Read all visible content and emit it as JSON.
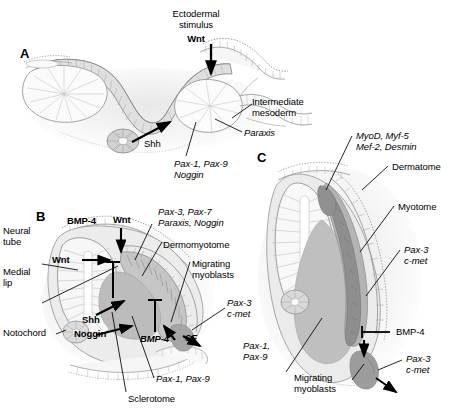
{
  "figure": {
    "type": "embryology-diagram"
  },
  "panels": {
    "a": {
      "letter": "A",
      "labels": {
        "ectodermal_stimulus": "Ectodermal\nstimulus",
        "wnt": "Wnt",
        "intermediate_mesoderm": "Intermediate\nmesoderm",
        "paraxis": "Paraxis",
        "shh": "Shh",
        "pax_noggin": "Pax-1, Pax-9\nNoggin"
      }
    },
    "b": {
      "letter": "B",
      "labels": {
        "neural_tube": "Neural\ntube",
        "medial_lip": "Medial\nlip",
        "notochord": "Notochord",
        "bmp4_top": "BMP-4",
        "wnt_top": "Wnt",
        "wnt_left": "Wnt",
        "shh": "Shh",
        "noggin": "Noggin",
        "bmp4_bottom": "BMP-4",
        "sf": "SF",
        "pax3_pax7": "Pax-3, Pax-7\nParaxis, Noggin",
        "dermomyotome": "Dermomyotome",
        "migrating_myoblasts": "Migrating\nmyoblasts",
        "pax3_cmet": "Pax-3\nc-met",
        "pax1_pax9": "Pax-1, Pax-9",
        "sclerotome": "Sclerotome"
      }
    },
    "c": {
      "letter": "C",
      "labels": {
        "myod": "MyoD, Myf-5\nMef-2, Desmin",
        "dermatome": "Dermatome",
        "myotome": "Myotome",
        "pax3_cmet_top": "Pax-3\nc-met",
        "bmp4": "BMP-4",
        "pax3_cmet_bottom": "Pax-3\nc-met",
        "pax1_pax9": "Pax-1,\nPax-9",
        "migrating_myoblasts": "Migrating\nmyoblasts"
      }
    }
  },
  "colors": {
    "background": "#ffffff",
    "ink": "#000000",
    "tissue_light": "#f4f4f4",
    "tissue_mid": "#e2e2e2",
    "tissue_gray": "#c9c9c9",
    "sclerotome": "#bdbdbd",
    "dermomyotome_dark": "#8f8f8f",
    "myotome_dark": "#9a9a9a",
    "outline": "#8a8a8a",
    "shadow": "#ededed"
  }
}
